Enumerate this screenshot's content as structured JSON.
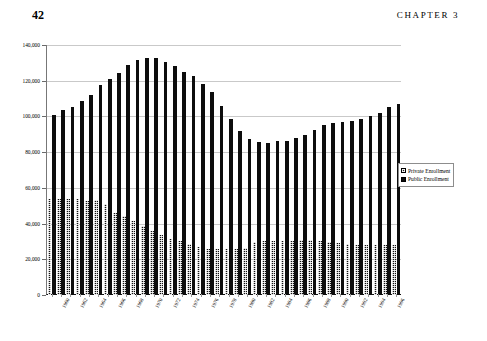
{
  "page": {
    "folio": "42",
    "running_head": "CHAPTER 3"
  },
  "legend": {
    "position": "right-inside",
    "entries": [
      {
        "label": "Private Enrollment",
        "swatch": "hatched-black"
      },
      {
        "label": "Public Enrollment",
        "swatch": "solid-black"
      }
    ]
  },
  "axis": {
    "y_ticks": [
      "0",
      "20,000",
      "40,000",
      "60,000",
      "80,000",
      "100,000",
      "120,000",
      "140,000"
    ],
    "y_tick_values": [
      0,
      20000,
      40000,
      60000,
      80000,
      100000,
      120000,
      140000
    ],
    "x_tick_labels": [
      "1960",
      "1962",
      "1964",
      "1966",
      "1968",
      "1970",
      "1972",
      "1974",
      "1976",
      "1978",
      "1980",
      "1982",
      "1984",
      "1986",
      "1988",
      "1990",
      "1992",
      "1994",
      "1996"
    ]
  },
  "chart_data": {
    "type": "bar",
    "title": "",
    "subtitle": "",
    "xlabel": "",
    "ylabel": "",
    "ylim": [
      0,
      140000
    ],
    "grid": true,
    "grid_axis": "y",
    "legend_position": "right-inside",
    "bar_mode": "grouped",
    "categories": [
      "1960",
      "1961",
      "1962",
      "1963",
      "1964",
      "1965",
      "1966",
      "1967",
      "1968",
      "1969",
      "1970",
      "1971",
      "1972",
      "1973",
      "1974",
      "1975",
      "1976",
      "1977",
      "1978",
      "1979",
      "1980",
      "1981",
      "1982",
      "1983",
      "1984",
      "1985",
      "1986",
      "1987",
      "1988",
      "1989",
      "1990",
      "1991",
      "1992",
      "1993",
      "1994",
      "1995",
      "1996",
      "1997"
    ],
    "series": [
      {
        "name": "Public Enrollment",
        "style": "solid-black",
        "values": [
          101000,
          103500,
          105500,
          108500,
          112000,
          117500,
          121000,
          124500,
          129000,
          131500,
          133000,
          132500,
          130500,
          128000,
          125000,
          122500,
          118000,
          113500,
          106000,
          98500,
          92000,
          87500,
          85500,
          85000,
          86000,
          86500,
          88000,
          89500,
          92500,
          95000,
          96500,
          97000,
          97500,
          98500,
          100500,
          102000,
          105500,
          107000
        ]
      },
      {
        "name": "Private Enrollment",
        "style": "hatched-black",
        "values": [
          54000,
          53500,
          53500,
          54000,
          52500,
          53000,
          51000,
          46000,
          44000,
          41500,
          38500,
          36000,
          33500,
          31500,
          30000,
          28500,
          27000,
          26000,
          25500,
          25500,
          26000,
          26500,
          29500,
          30500,
          30500,
          30500,
          30500,
          31000,
          31000,
          30500,
          29500,
          29000,
          28500,
          28000,
          28000,
          28000,
          28000,
          28000
        ]
      }
    ]
  }
}
